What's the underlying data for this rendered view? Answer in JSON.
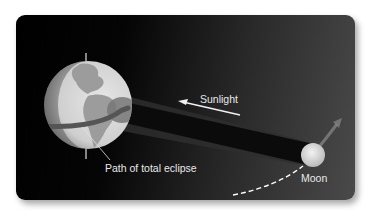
{
  "diagram": {
    "labels": {
      "sunlight": "Sunlight",
      "path": "Path of total eclipse",
      "moon": "Moon"
    },
    "colors": {
      "background_dark": "#000000",
      "background_light": "#4a4a4a",
      "earth_land": "#9a9a9a",
      "earth_ocean": "#d4d4d4",
      "shadow": "#111111",
      "label": "#e8e8e8"
    }
  }
}
